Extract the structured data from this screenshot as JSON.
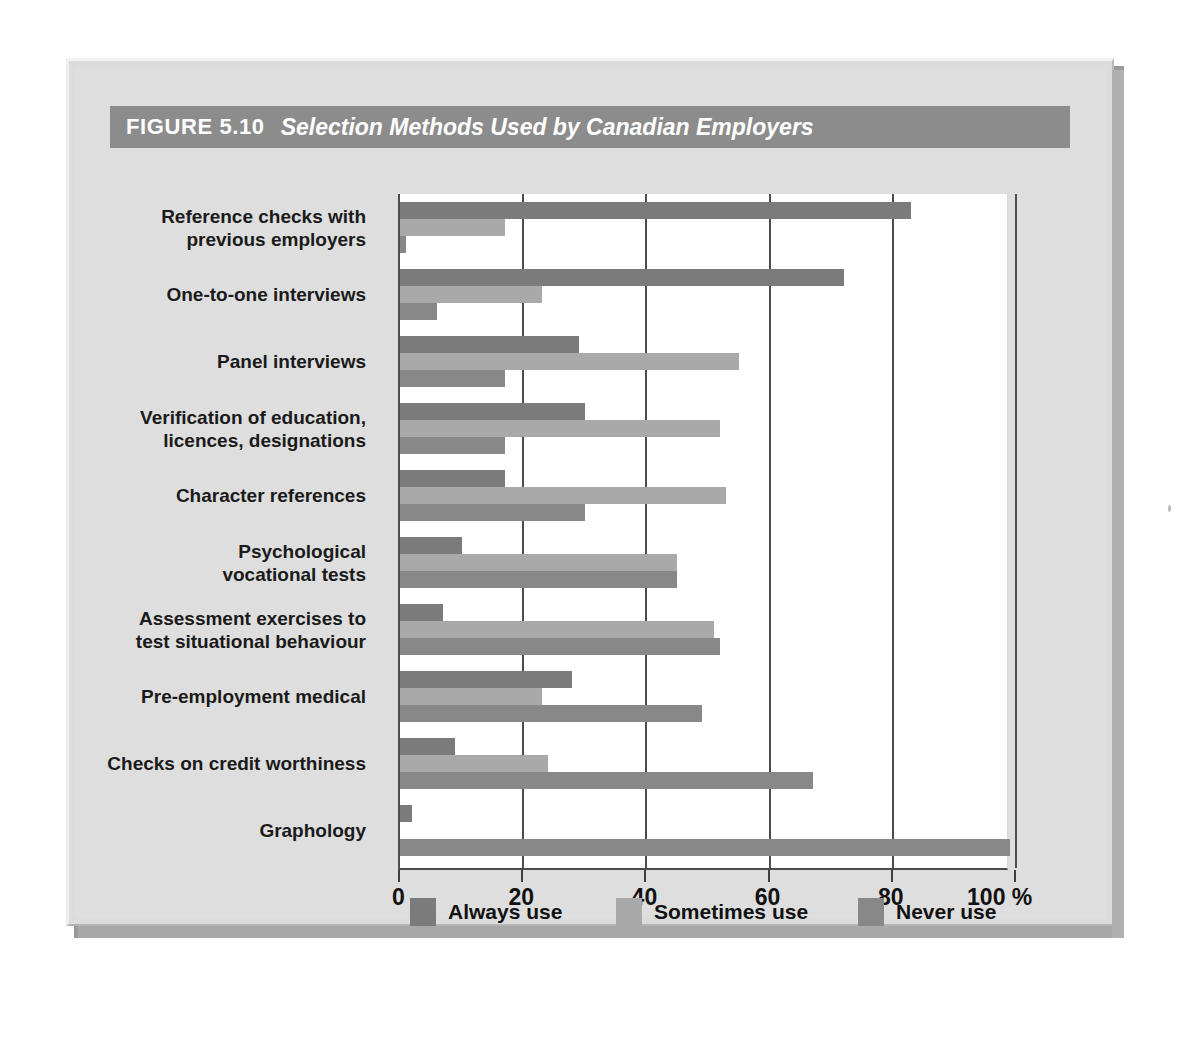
{
  "figure": {
    "number": "FIGURE 5.10",
    "title": "Selection Methods Used by Canadian Employers"
  },
  "chart_data": {
    "type": "bar",
    "orientation": "horizontal",
    "grouped": true,
    "title": "Selection Methods Used by Canadian Employers",
    "xlabel": "%",
    "ylabel": "",
    "xlim": [
      0,
      100
    ],
    "xticks": [
      0,
      20,
      40,
      60,
      80,
      100
    ],
    "xtick_labels": [
      "0",
      "20",
      "40",
      "60",
      "80",
      "100 %"
    ],
    "grid": "vertical",
    "legend_position": "bottom",
    "categories": [
      "Reference checks with\nprevious employers",
      "One-to-one interviews",
      "Panel interviews",
      "Verification of education,\nlicences, designations",
      "Character references",
      "Psychological\nvocational tests",
      "Assessment exercises to\ntest situational behaviour",
      "Pre-employment medical",
      "Checks on credit worthiness",
      "Graphology"
    ],
    "series": [
      {
        "name": "Always use",
        "color": "#7b7b7b",
        "values": [
          83,
          72,
          29,
          30,
          17,
          10,
          7,
          28,
          9,
          2
        ]
      },
      {
        "name": "Sometimes use",
        "color": "#a9a9a9",
        "values": [
          17,
          23,
          55,
          52,
          53,
          45,
          51,
          23,
          24,
          0
        ]
      },
      {
        "name": "Never use",
        "color": "#888888",
        "values": [
          1,
          6,
          17,
          17,
          30,
          45,
          52,
          49,
          67,
          99
        ]
      }
    ]
  },
  "legend": {
    "items": [
      {
        "label": "Always use",
        "color": "#7b7b7b"
      },
      {
        "label": "Sometimes use",
        "color": "#a9a9a9"
      },
      {
        "label": "Never use",
        "color": "#888888"
      }
    ]
  },
  "colors": {
    "title_bar": "#8c8c8c",
    "frame": "#dedede",
    "plot_bg": "#ffffff",
    "axis": "#4c4c4c"
  }
}
